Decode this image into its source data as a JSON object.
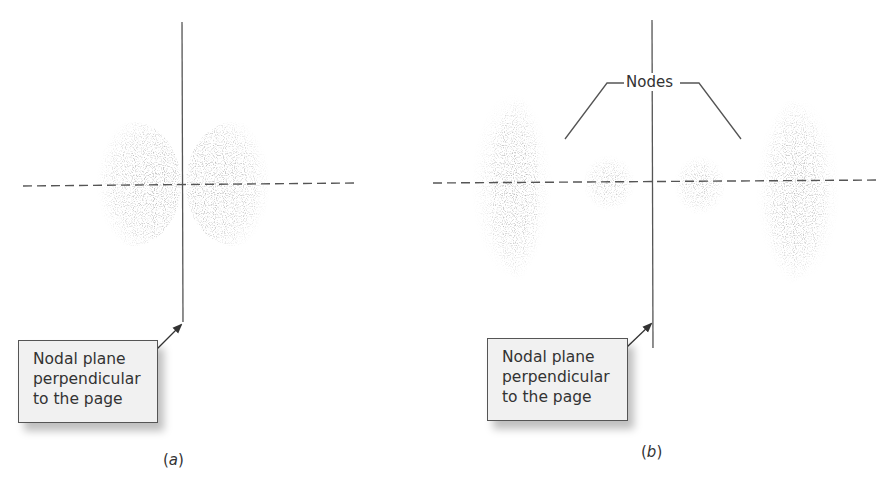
{
  "figure": {
    "panels": [
      {
        "id": "a",
        "caption_open": "(",
        "caption_letter": "a",
        "caption_close": ")",
        "label_lines": [
          "Nodal plane",
          "perpendicular",
          "to the page"
        ]
      },
      {
        "id": "b",
        "caption_open": "(",
        "caption_letter": "b",
        "caption_close": ")",
        "label_lines": [
          "Nodal plane",
          "perpendicular",
          "to the page"
        ],
        "nodes_label": "Nodes"
      }
    ]
  },
  "colors": {
    "line": "#555555",
    "density": "#707070",
    "box_fill": "#f1f1f1"
  }
}
